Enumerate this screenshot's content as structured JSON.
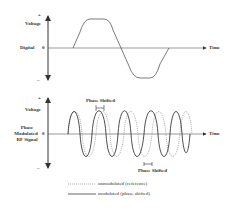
{
  "top_panel": {
    "y_axis_plus": "+",
    "y_axis_minus": "−",
    "y_label": "Voltage",
    "signal_label": "Digital",
    "zero_label": "0",
    "x_label": "Time"
  },
  "bottom_panel": {
    "y_axis_plus": "+",
    "y_axis_minus": "−",
    "y_label": "Voltage",
    "signal_label_line1": "Phase",
    "signal_label_line2": "Modulated",
    "signal_label_line3": "RF Signal",
    "zero_label": "0",
    "x_label": "Time",
    "annotation_top": "Phase Shifted",
    "annotation_bottom": "Phase Shifted"
  },
  "legend": {
    "items": [
      {
        "style": "dotted",
        "label": "unmodulated (reference)"
      },
      {
        "style": "solid",
        "label": "modulated (phase shifted)"
      }
    ]
  },
  "colors": {
    "line": "#333333",
    "dotted": "#777777"
  }
}
